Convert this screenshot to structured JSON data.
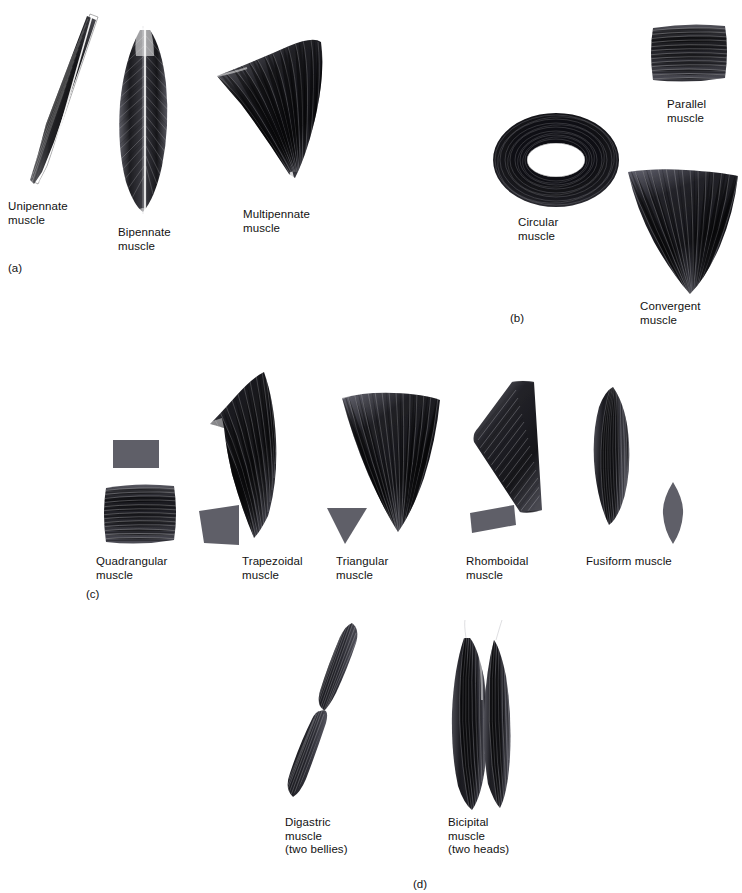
{
  "figure": {
    "background_color": "#ffffff",
    "ink_color": "#121212",
    "gray_shape_color": "#5f5f68"
  },
  "panels": [
    {
      "id": "a",
      "letter": "(a)",
      "theme": "pennate muscle architecture",
      "items": [
        {
          "name": "unipennate",
          "label": "Unipennate\nmuscle",
          "art": "unipennate-muscle-illustration"
        },
        {
          "name": "bipennate",
          "label": "Bipennate\nmuscle",
          "art": "bipennate-muscle-illustration"
        },
        {
          "name": "multipennate",
          "label": "Multipennate\nmuscle",
          "art": "multipennate-muscle-illustration"
        }
      ]
    },
    {
      "id": "b",
      "letter": "(b)",
      "theme": "fibre direction",
      "items": [
        {
          "name": "parallel",
          "label": "Parallel\nmuscle",
          "art": "parallel-muscle-illustration"
        },
        {
          "name": "circular",
          "label": "Circular\nmuscle",
          "art": "circular-muscle-illustration"
        },
        {
          "name": "convergent",
          "label": "Convergent\nmuscle",
          "art": "convergent-muscle-illustration"
        }
      ]
    },
    {
      "id": "c",
      "letter": "(c)",
      "theme": "geometric outline shapes",
      "items": [
        {
          "name": "quadrangular",
          "label": "Quadrangular\nmuscle",
          "art": "quadrangular-muscle-illustration",
          "shape": "rectangle"
        },
        {
          "name": "trapezoidal",
          "label": "Trapezoidal\nmuscle",
          "art": "trapezoidal-muscle-illustration",
          "shape": "trapezoid"
        },
        {
          "name": "triangular",
          "label": "Triangular\nmuscle",
          "art": "triangular-muscle-illustration",
          "shape": "triangle"
        },
        {
          "name": "rhomboidal",
          "label": "Rhomboidal\nmuscle",
          "art": "rhomboidal-muscle-illustration",
          "shape": "rhomboid"
        },
        {
          "name": "fusiform",
          "label": "Fusiform muscle",
          "art": "fusiform-muscle-illustration",
          "shape": "spindle"
        }
      ]
    },
    {
      "id": "d",
      "letter": "(d)",
      "theme": "number of bellies and heads",
      "items": [
        {
          "name": "digastric",
          "label": "Digastric\nmuscle\n(two bellies)",
          "art": "digastric-muscle-illustration"
        },
        {
          "name": "bicipital",
          "label": "Bicipital\nmuscle\n(two heads)",
          "art": "bicipital-muscle-illustration"
        }
      ]
    }
  ]
}
